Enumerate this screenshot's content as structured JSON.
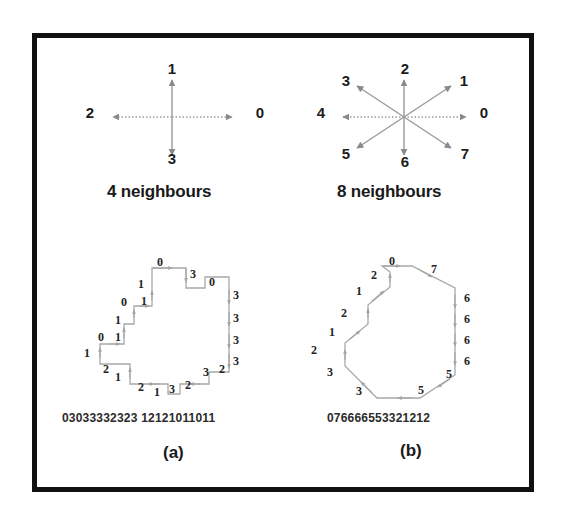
{
  "figure": {
    "background_color": "#ffffff",
    "frame_color": "#111111",
    "arrow_color": "#8a8a8a",
    "contour_color": "#9a9a9a",
    "text_color": "#1a1a1a"
  },
  "panels": {
    "top_left": {
      "title": "4 neighbours",
      "directions": [
        {
          "code": "0",
          "angle_deg": 0,
          "x": 253,
          "y": 110
        },
        {
          "code": "1",
          "angle_deg": 90,
          "x": 168,
          "y": 63
        },
        {
          "code": "2",
          "angle_deg": 180,
          "x": 83,
          "y": 110
        },
        {
          "code": "3",
          "angle_deg": 270,
          "x": 168,
          "y": 151
        }
      ]
    },
    "top_right": {
      "title": "8 neighbours",
      "directions": [
        {
          "code": "0",
          "angle_deg": 0,
          "x": 480,
          "y": 110
        },
        {
          "code": "1",
          "angle_deg": 45,
          "x": 458,
          "y": 74
        },
        {
          "code": "2",
          "angle_deg": 90,
          "x": 402,
          "y": 62
        },
        {
          "code": "3",
          "angle_deg": 135,
          "x": 342,
          "y": 74
        },
        {
          "code": "4",
          "angle_deg": 180,
          "x": 317,
          "y": 110
        },
        {
          "code": "5",
          "angle_deg": 225,
          "x": 342,
          "y": 148
        },
        {
          "code": "6",
          "angle_deg": 270,
          "x": 402,
          "y": 157
        },
        {
          "code": "7",
          "angle_deg": 315,
          "x": 461,
          "y": 148
        }
      ]
    },
    "bottom_left": {
      "caption": "(a)",
      "chain_code": "03033332323 12121011011",
      "code_labels": [
        {
          "code": "0",
          "x": 160,
          "y": 262
        },
        {
          "code": "3",
          "x": 193,
          "y": 274
        },
        {
          "code": "0",
          "x": 212,
          "y": 282
        },
        {
          "code": "1",
          "x": 141,
          "y": 284
        },
        {
          "code": "3",
          "x": 236,
          "y": 295
        },
        {
          "code": "0",
          "x": 124,
          "y": 302
        },
        {
          "code": "1",
          "x": 144,
          "y": 301
        },
        {
          "code": "3",
          "x": 236,
          "y": 318
        },
        {
          "code": "1",
          "x": 118,
          "y": 320
        },
        {
          "code": "3",
          "x": 236,
          "y": 340
        },
        {
          "code": "0",
          "x": 101,
          "y": 337
        },
        {
          "code": "1",
          "x": 118,
          "y": 337
        },
        {
          "code": "3",
          "x": 236,
          "y": 361
        },
        {
          "code": "1",
          "x": 87,
          "y": 353
        },
        {
          "code": "2",
          "x": 106,
          "y": 369
        },
        {
          "code": "1",
          "x": 118,
          "y": 377
        },
        {
          "code": "3",
          "x": 206,
          "y": 372
        },
        {
          "code": "2",
          "x": 222,
          "y": 369
        },
        {
          "code": "2",
          "x": 141,
          "y": 387
        },
        {
          "code": "1",
          "x": 157,
          "y": 392
        },
        {
          "code": "3",
          "x": 172,
          "y": 389
        },
        {
          "code": "2",
          "x": 188,
          "y": 385
        }
      ]
    },
    "bottom_right": {
      "caption": "(b)",
      "chain_code": "076666553321212",
      "code_labels": [
        {
          "code": "0",
          "x": 392,
          "y": 261
        },
        {
          "code": "7",
          "x": 434,
          "y": 269
        },
        {
          "code": "2",
          "x": 374,
          "y": 275
        },
        {
          "code": "1",
          "x": 359,
          "y": 291
        },
        {
          "code": "6",
          "x": 465,
          "y": 298
        },
        {
          "code": "2",
          "x": 344,
          "y": 313
        },
        {
          "code": "6",
          "x": 465,
          "y": 319
        },
        {
          "code": "1",
          "x": 332,
          "y": 332
        },
        {
          "code": "6",
          "x": 465,
          "y": 340
        },
        {
          "code": "2",
          "x": 314,
          "y": 350
        },
        {
          "code": "6",
          "x": 465,
          "y": 361
        },
        {
          "code": "3",
          "x": 330,
          "y": 372
        },
        {
          "code": "5",
          "x": 447,
          "y": 374
        },
        {
          "code": "3",
          "x": 359,
          "y": 391
        },
        {
          "code": "5",
          "x": 421,
          "y": 390
        }
      ]
    }
  }
}
